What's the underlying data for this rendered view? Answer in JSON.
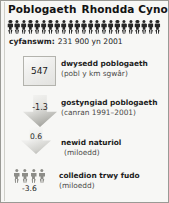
{
  "title": {
    "topic": "Poblogaeth",
    "place": "Rhondda Cynon Taf"
  },
  "total": {
    "label": "cyfanswm:",
    "value": "231 900 yn 2001",
    "pictogram_icon": "person-icon",
    "pictogram_count": 23
  },
  "rows": [
    {
      "marker": "square",
      "marker_icon": "square-swatch",
      "value": "547",
      "label_line1": "dwysedd poblogaeth",
      "label_line2": "(pobl y km sgwâr)"
    },
    {
      "marker": "arrow-down-large",
      "marker_icon": "arrow-down-icon",
      "value": "-1.3",
      "label_line1": "gostyngiad poblogaeth",
      "label_line2": "(canran 1991–2001)"
    },
    {
      "marker": "arrow-down-small",
      "marker_icon": "arrow-down-icon",
      "value": "0.6",
      "label_line1": "newid naturiol",
      "label_unit": "(miloedd)"
    },
    {
      "marker": "people-group",
      "marker_icon": "person-icon",
      "people_count": 4,
      "value": "-3.6",
      "label_line1": "colledion trwy fudo",
      "label_line2": "(miloedd)"
    }
  ],
  "colors": {
    "panel_bg": "#f7f7f5",
    "panel_border": "#9a9a95",
    "text": "#1b1b1b",
    "muted_text": "#4a4a48",
    "pictogram_dark": "#262626",
    "pictogram_grey": "#8d8d88"
  }
}
